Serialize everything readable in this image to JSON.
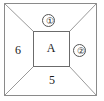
{
  "figure": {
    "type": "labeled-square-diagram",
    "colors": {
      "stroke": "#8a8a8a",
      "inner_stroke": "#6b6b6b",
      "text": "#1a1a1a",
      "background": "#ffffff"
    },
    "outer_square": {
      "x": 4,
      "y": 3,
      "width": 93,
      "height": 93
    },
    "inner_square": {
      "x": 33,
      "y": 31,
      "width": 36,
      "height": 35
    },
    "labels": {
      "top": {
        "text": "①",
        "circled": true,
        "region": "top-trapezoid"
      },
      "right": {
        "text": "②",
        "circled": true,
        "region": "right-trapezoid"
      },
      "left": {
        "text": "6",
        "circled": false,
        "region": "left-trapezoid"
      },
      "bottom": {
        "text": "5",
        "circled": false,
        "region": "bottom-trapezoid"
      },
      "center": {
        "text": "A",
        "circled": false,
        "region": "inner-square"
      }
    }
  }
}
